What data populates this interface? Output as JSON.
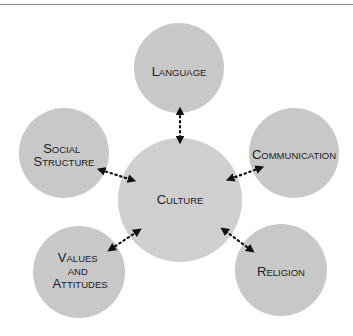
{
  "colors": {
    "node_fill": "#c8c8c8",
    "text": "#222222",
    "arrow": "#111111",
    "rule": "#8a8a8a"
  },
  "center": {
    "lines": [
      {
        "cap": "C",
        "rest": "ULTURE"
      }
    ]
  },
  "nodes": [
    {
      "id": "language",
      "lines": [
        {
          "cap": "L",
          "rest": "ANGUAGE"
        }
      ]
    },
    {
      "id": "social-structure",
      "lines": [
        {
          "cap": "S",
          "rest": "OCIAL"
        },
        {
          "cap": "S",
          "rest": "TRUCTURE"
        }
      ]
    },
    {
      "id": "communication",
      "lines": [
        {
          "cap": "C",
          "rest": "OMMUNICATION"
        }
      ]
    },
    {
      "id": "values-attitudes",
      "lines": [
        {
          "cap": "V",
          "rest": "ALUES"
        },
        {
          "cap": "",
          "rest": "AND"
        },
        {
          "cap": "A",
          "rest": "TTITUDES"
        }
      ]
    },
    {
      "id": "religion",
      "lines": [
        {
          "cap": "R",
          "rest": "ELIGION"
        }
      ]
    }
  ]
}
